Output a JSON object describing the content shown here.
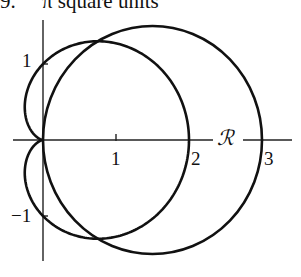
{
  "caption": {
    "number": "9.",
    "text": "π square units"
  },
  "figure": {
    "curves": [
      {
        "name": "cardioid",
        "equation": "r = 1 + cos θ"
      },
      {
        "name": "circle",
        "equation": "r = 3 cos θ"
      }
    ],
    "axis_labels": {
      "polar_axis": "ℛ",
      "x_tick_1": "1",
      "x_tick_2": "2",
      "x_tick_3": "3",
      "y_tick_pos": "1",
      "y_tick_neg": "−1"
    },
    "stroke_color": "#111111",
    "background_color": "#ffffff"
  }
}
